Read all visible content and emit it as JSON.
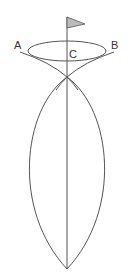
{
  "diagram": {
    "labels": {
      "a": "A",
      "b": "B",
      "c": "C"
    },
    "colors": {
      "stroke": "#555555",
      "flag_fill": "#bbbbbb",
      "background": "#ffffff"
    }
  }
}
